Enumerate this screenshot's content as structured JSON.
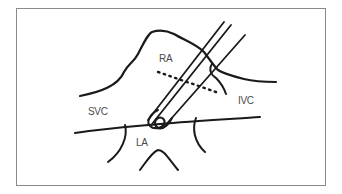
{
  "diagram": {
    "labels": {
      "ra": "RA",
      "svc": "SVC",
      "ivc": "IVC",
      "la": "LA"
    },
    "colors": {
      "stroke": "#1a1a1a",
      "label": "#4a4a4a",
      "border": "#8a8a8a",
      "background": "#ffffff"
    }
  }
}
